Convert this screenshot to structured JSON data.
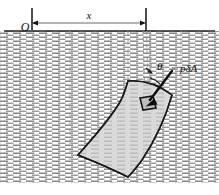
{
  "figure": {
    "labels": {
      "origin": "O",
      "horizontal_distance": "x",
      "angle": "θ",
      "pressure_force": "pδA"
    },
    "colors": {
      "ink": "#111111",
      "plate_fill": "#cfcfcf",
      "plate_stroke": "#1a1a1a",
      "fluid_hatch": "#6e6e6e",
      "dashed_guide": "#8f8f8f",
      "surface_line": "#222222",
      "background": "#ffffff"
    },
    "geometry": {
      "free_surface_y": 31,
      "fluid_bottom_y": 183,
      "origin_x": 32,
      "dimension_line_y": 23,
      "dimension_end_x": 146,
      "element_center": [
        148,
        105
      ],
      "arrow_tail": [
        171,
        73
      ],
      "arrow_head": [
        146,
        106
      ]
    },
    "annotations": {
      "origin_desc": "origin marker at free surface",
      "x_desc": "horizontal distance from origin to element",
      "theta_desc": "angle between vertical and pressure force direction",
      "force_desc": "elemental pressure force acting normal to the surface"
    }
  }
}
